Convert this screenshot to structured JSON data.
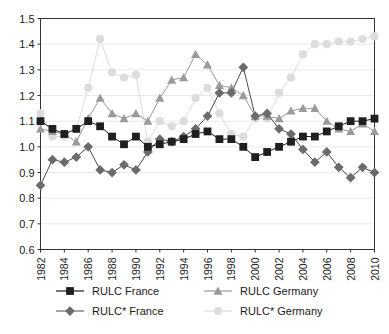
{
  "chart_data": {
    "type": "line",
    "title": "",
    "subtitle": "",
    "xlabel": "",
    "ylabel": "",
    "xlim": [
      1982,
      2010
    ],
    "ylim": [
      0.6,
      1.5
    ],
    "ytick_labels": [
      "1.5",
      "1.4",
      "1.3",
      "1.2",
      "1.1",
      "1.0",
      "0.9",
      "0.8",
      "0.7",
      "0.6"
    ],
    "ytick_values": [
      1.5,
      1.4,
      1.3,
      1.2,
      1.1,
      1.0,
      0.9,
      0.8,
      0.7,
      0.6
    ],
    "grid": true,
    "grid_axis": "y",
    "legend_position": "bottom",
    "x": [
      1982,
      1983,
      1984,
      1985,
      1986,
      1987,
      1988,
      1989,
      1990,
      1991,
      1992,
      1993,
      1994,
      1995,
      1996,
      1997,
      1998,
      1999,
      2000,
      2001,
      2002,
      2003,
      2004,
      2005,
      2006,
      2007,
      2008,
      2009,
      2010
    ],
    "xtick_labels": [
      "1982",
      "1984",
      "1986",
      "1988",
      "1990",
      "1992",
      "1994",
      "1996",
      "1998",
      "2000",
      "2002",
      "2004",
      "2006",
      "2008",
      "2010"
    ],
    "xtick_values": [
      1982,
      1984,
      1986,
      1988,
      1990,
      1992,
      1994,
      1996,
      1998,
      2000,
      2002,
      2004,
      2006,
      2008,
      2010
    ],
    "series": [
      {
        "name": "RULC France",
        "marker": "square",
        "color": "#1f1f1f",
        "line_color": "#1f1f1f",
        "values": [
          1.1,
          1.07,
          1.05,
          1.07,
          1.1,
          1.08,
          1.04,
          1.01,
          1.04,
          1.0,
          1.01,
          1.02,
          1.03,
          1.05,
          1.06,
          1.03,
          1.03,
          1.0,
          0.96,
          0.98,
          1.0,
          1.02,
          1.04,
          1.04,
          1.06,
          1.08,
          1.1,
          1.1,
          1.11
        ]
      },
      {
        "name": "RULC Germany",
        "marker": "triangle",
        "color": "#9a9a9a",
        "line_color": "#9a9a9a",
        "values": [
          1.07,
          1.06,
          1.05,
          1.02,
          1.11,
          1.19,
          1.13,
          1.11,
          1.13,
          1.1,
          1.19,
          1.26,
          1.27,
          1.36,
          1.32,
          1.24,
          1.23,
          1.2,
          1.12,
          1.12,
          1.11,
          1.14,
          1.15,
          1.15,
          1.1,
          1.07,
          1.06,
          1.09,
          1.06
        ]
      },
      {
        "name": "RULC* France",
        "marker": "diamond",
        "color": "#6b6b6b",
        "line_color": "#4a4a4a",
        "values": [
          0.85,
          0.95,
          0.94,
          0.96,
          1.0,
          0.91,
          0.9,
          0.93,
          0.91,
          0.98,
          1.03,
          1.02,
          1.04,
          1.07,
          1.12,
          1.21,
          1.21,
          1.31,
          1.12,
          1.13,
          1.07,
          1.05,
          0.99,
          0.94,
          0.98,
          0.92,
          0.88,
          0.92,
          0.9
        ]
      },
      {
        "name": "RULC* Germany",
        "marker": "circle",
        "color": "#dcdcdc",
        "line_color": "#dcdcdc",
        "values": [
          1.13,
          1.04,
          1.04,
          1.07,
          1.23,
          1.42,
          1.29,
          1.27,
          1.28,
          1.02,
          1.1,
          1.08,
          1.1,
          1.19,
          1.23,
          1.13,
          1.05,
          1.04,
          1.11,
          1.11,
          1.21,
          1.27,
          1.36,
          1.4,
          1.4,
          1.41,
          1.41,
          1.42,
          1.43
        ]
      }
    ]
  },
  "legend": {
    "items": [
      {
        "label": "RULC France",
        "marker": "square",
        "color": "#1f1f1f"
      },
      {
        "label": "RULC Germany",
        "marker": "triangle",
        "color": "#9a9a9a"
      },
      {
        "label": "RULC* France",
        "marker": "diamond",
        "color": "#6b6b6b"
      },
      {
        "label": "RULC* Germany",
        "marker": "circle",
        "color": "#dcdcdc"
      }
    ]
  },
  "colors": {
    "axis": "#333333",
    "grid": "#e9e9e9",
    "plot_background": "#ffffff",
    "page_background": "#ffffff"
  }
}
